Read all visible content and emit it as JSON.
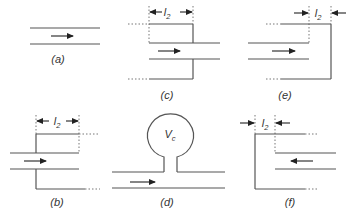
{
  "figure": {
    "panels": {
      "a": {
        "caption": "(a)"
      },
      "b": {
        "caption": "(b)",
        "dimension_label": "l",
        "dimension_sub": "2"
      },
      "c": {
        "caption": "(c)",
        "dimension_label": "l",
        "dimension_sub": "2"
      },
      "d": {
        "caption": "(d)",
        "volume_label": "V",
        "volume_sub": "c"
      },
      "e": {
        "caption": "(e)",
        "dimension_label": "l",
        "dimension_sub": "2"
      },
      "f": {
        "caption": "(f)",
        "dimension_label": "l",
        "dimension_sub": "2"
      }
    },
    "flow_direction": {
      "a": "right",
      "b": "right",
      "c": "right",
      "d": "right",
      "e": "right",
      "f": "left"
    },
    "colors": {
      "line": "#555555",
      "arrow": "#222222",
      "text": "#333333"
    }
  }
}
